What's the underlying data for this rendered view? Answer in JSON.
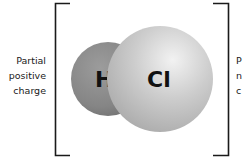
{
  "diagram": {
    "molecule": "HCl",
    "atoms": [
      {
        "symbol": "H",
        "fill": "#8a8a8a"
      },
      {
        "symbol": "Cl",
        "fill": "#c8c8c8"
      }
    ],
    "left_label": [
      "Partial",
      "positive",
      "charge"
    ],
    "right_label": [
      "P",
      "n",
      "c"
    ],
    "bracket_color": "#1a1a1a"
  }
}
